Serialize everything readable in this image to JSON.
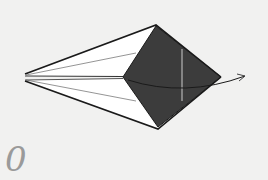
{
  "diagram": {
    "type": "origami-step",
    "step_number": "0",
    "colors": {
      "background": "#f1f1f0",
      "paper_white": "#ffffff",
      "paper_colored": "#3c3c3c",
      "outline": "#1a1a1a",
      "crease": "#7a7a7a",
      "light_crease": "#b5b5b5",
      "arrow": "#444444",
      "step_number": "#9a9a9a"
    },
    "shapes": {
      "outer_top_wing": [
        [
          25,
          74
        ],
        [
          156,
          25
        ],
        [
          123,
          77
        ],
        [
          25,
          77
        ]
      ],
      "outer_bottom_wing": [
        [
          25,
          81
        ],
        [
          123,
          78
        ],
        [
          158,
          129
        ]
      ],
      "colored_diamond": [
        [
          123,
          77
        ],
        [
          156,
          26
        ],
        [
          221,
          77
        ],
        [
          158,
          127
        ]
      ]
    },
    "arrow": {
      "label": "fold-direction-arrow",
      "path": "M128 80 Q 185 98 245 76"
    }
  }
}
